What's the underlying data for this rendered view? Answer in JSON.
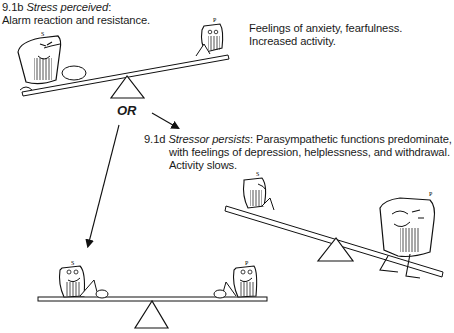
{
  "panel_b": {
    "number": "9.1b",
    "title": "Stress perceived",
    "colon": ":",
    "line2": "Alarm reaction and resistance.",
    "right_line1": "Feelings of anxiety, fearfulness.",
    "right_line2": "Increased activity.",
    "left_char_label": "S",
    "right_char_label": "P"
  },
  "connector": {
    "or_label": "OR"
  },
  "panel_d": {
    "number": "9.1d",
    "title": "Stressor persists",
    "colon": ":",
    "line1_rest": " Parasympathetic functions predominate,",
    "line2": "with feelings of depression, helplessness, and withdrawal.",
    "line3": "Activity slows.",
    "left_char_label": "S",
    "right_char_label": "P"
  },
  "panel_balanced": {
    "left_char_label": "S",
    "right_char_label": "P"
  }
}
